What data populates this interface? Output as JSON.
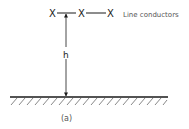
{
  "diagram": {
    "conductor_symbol": "X",
    "conductors": [
      {
        "id": "c1",
        "label": "X"
      },
      {
        "id": "c2",
        "label": "X"
      },
      {
        "id": "c3",
        "label": "X"
      }
    ],
    "conductors_label": "Line conductors",
    "height_label": "h",
    "caption": "(a)",
    "colors": {
      "line": "#1a1a1a",
      "text": "#222222",
      "label": "#555555",
      "background": "#ffffff"
    }
  }
}
